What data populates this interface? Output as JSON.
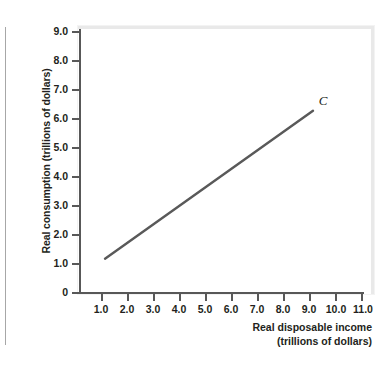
{
  "chart_data": {
    "type": "line",
    "title": "",
    "subtitle": "",
    "xlabel_line1": "Real disposable income",
    "xlabel_line2": "(trillions of dollars)",
    "ylabel": "Real consumption (trillions of dollars)",
    "xlim": [
      0,
      11.6
    ],
    "ylim": [
      0,
      9.0
    ],
    "grid": false,
    "legend_position": "none",
    "x_ticks": [
      "1.0",
      "2.0",
      "3.0",
      "4.0",
      "5.0",
      "6.0",
      "7.0",
      "8.0",
      "9.0",
      "10.0",
      "11.0"
    ],
    "x_tick_values": [
      1,
      2,
      3,
      4,
      5,
      6,
      7,
      8,
      9,
      10,
      11
    ],
    "y_ticks": [
      "0",
      "1.0",
      "2.0",
      "3.0",
      "4.0",
      "5.0",
      "6.0",
      "7.0",
      "8.0",
      "9.0"
    ],
    "y_tick_values": [
      0,
      1,
      2,
      3,
      4,
      5,
      6,
      7,
      8,
      9
    ],
    "series": [
      {
        "name": "C",
        "label": "C",
        "color": "#595959",
        "x": [
          1.0,
          9.0
        ],
        "y": [
          1.15,
          6.25
        ],
        "annotation": "C",
        "annotation_x": 9.3,
        "annotation_y": 6.6
      }
    ],
    "annotations": [
      {
        "text": "C",
        "x": 9.3,
        "y": 6.6,
        "style": "italic"
      }
    ]
  }
}
